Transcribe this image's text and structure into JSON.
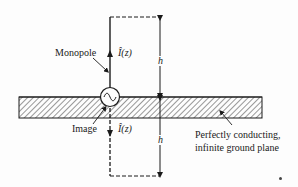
{
  "diagram": {
    "labels": {
      "monopole": "Monopole",
      "image": "Image",
      "current_top": "Î(z)",
      "current_bottom": "Î(z)",
      "height_top": "h",
      "height_bottom": "h",
      "ground_line1": "Perfectly conducting,",
      "ground_line2": "infinite ground plane"
    },
    "elements": [
      "monopole-antenna",
      "image-antenna",
      "voltage-source",
      "ground-plane",
      "dimension-arrows"
    ],
    "colors": {
      "ink": "#1a1a1a",
      "background": "#fdfdfd"
    }
  }
}
